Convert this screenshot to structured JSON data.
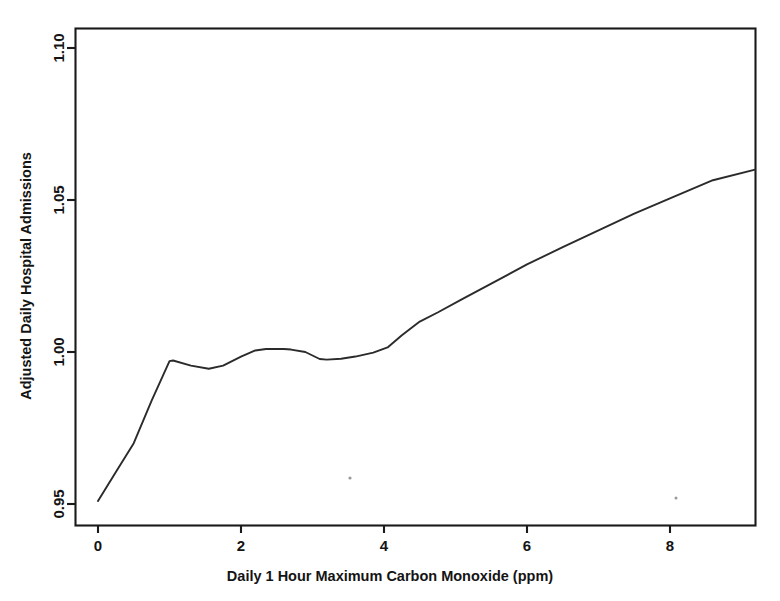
{
  "chart_data": {
    "type": "line",
    "title": "",
    "subtitle": "",
    "xlabel": "Daily 1 Hour Maximum Carbon Monoxide (ppm)",
    "ylabel": "Adjusted Daily Hospital Admissions",
    "xlim": [
      -0.38,
      9.58
    ],
    "ylim": [
      0.9437,
      1.1035
    ],
    "xticks": [
      0,
      2,
      4,
      6,
      8
    ],
    "xtick_labels": [
      "0",
      "2",
      "4",
      "6",
      "8"
    ],
    "yticks": [
      0.95,
      1.0,
      1.05,
      1.1
    ],
    "ytick_labels": [
      "0.95",
      "1.00",
      "1.05",
      "1.10"
    ],
    "grid": false,
    "legend": null,
    "series": [
      {
        "name": "Adjusted daily hospital admissions vs CO",
        "color": "#2b2b2b",
        "x": [
          0.0,
          0.25,
          0.5,
          0.75,
          1.0,
          1.05,
          1.3,
          1.55,
          1.75,
          2.0,
          2.2,
          2.35,
          2.6,
          2.7,
          2.9,
          3.1,
          3.2,
          3.4,
          3.6,
          3.85,
          4.05,
          4.25,
          4.5,
          4.75,
          5.1,
          5.5,
          6.0,
          6.5,
          7.0,
          7.5,
          8.0,
          8.6,
          9.19
        ],
        "y": [
          0.951,
          0.9605,
          0.97,
          0.984,
          0.997,
          0.9972,
          0.9955,
          0.9945,
          0.9955,
          0.9985,
          1.0005,
          1.001,
          1.001,
          1.0008,
          1.0,
          0.9977,
          0.9975,
          0.9978,
          0.9985,
          0.9998,
          1.0015,
          1.0055,
          1.01,
          1.013,
          1.0175,
          1.0225,
          1.0288,
          1.0345,
          1.04,
          1.0455,
          1.0505,
          1.0565,
          1.06
        ]
      }
    ],
    "annotations": [],
    "axis_line_color": "#1a1a1a"
  },
  "axis": {
    "x_title": "Daily 1 Hour Maximum Carbon Monoxide (ppm)",
    "y_title": "Adjusted Daily Hospital Admissions",
    "x_tick_0": "0",
    "x_tick_1": "2",
    "x_tick_2": "4",
    "x_tick_3": "6",
    "x_tick_4": "8",
    "y_tick_0": "0.95",
    "y_tick_1": "1.00",
    "y_tick_2": "1.05",
    "y_tick_3": "1.10"
  }
}
